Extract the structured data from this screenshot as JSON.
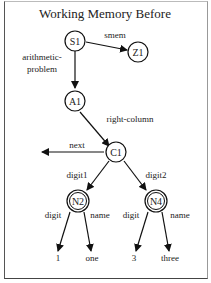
{
  "title": "Working Memory Before",
  "nodes": {
    "S1": "S1",
    "Z1": "Z1",
    "A1": "A1",
    "C1": "C1",
    "N2": "N2",
    "N4": "N4"
  },
  "edges": {
    "smem": "smem",
    "arith1": "arithmetic-",
    "arith2": "problem",
    "right_column": "right-column",
    "next": "next",
    "digit1": "digit1",
    "digit2": "digit2",
    "n2_digit": "digit",
    "n2_name": "name",
    "n4_digit": "digit",
    "n4_name": "name"
  },
  "values": {
    "n2_digit_val": "1",
    "n2_name_val": "one",
    "n4_digit_val": "3",
    "n4_name_val": "three"
  }
}
